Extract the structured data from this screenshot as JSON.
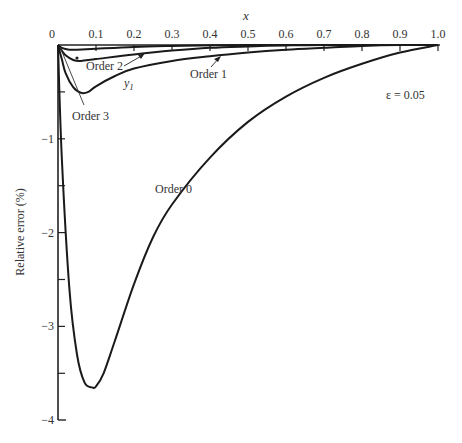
{
  "chart_data": {
    "type": "line",
    "title": "",
    "xlabel": "x",
    "ylabel": "Relative error (%)",
    "xlim": [
      0,
      1.0
    ],
    "ylim": [
      -4,
      0
    ],
    "x_ticks": [
      "0",
      "0.1",
      "0.2",
      "0.3",
      "0.4",
      "0.5",
      "0.6",
      "0.7",
      "0.8",
      "0.9",
      "1.0"
    ],
    "y_ticks": [
      "0",
      "-1",
      "-2",
      "-3",
      "-4"
    ],
    "x_axis_position": "top",
    "grid": false,
    "annotation": "ε = 0.05",
    "series": [
      {
        "name": "Order 0",
        "x": [
          0,
          0.01,
          0.03,
          0.05,
          0.07,
          0.09,
          0.1,
          0.12,
          0.15,
          0.2,
          0.25,
          0.3,
          0.4,
          0.5,
          0.6,
          0.7,
          0.8,
          0.9,
          1.0
        ],
        "y": [
          0,
          -1.2,
          -2.6,
          -3.3,
          -3.6,
          -3.65,
          -3.64,
          -3.5,
          -3.15,
          -2.55,
          -2.05,
          -1.7,
          -1.2,
          -0.82,
          -0.55,
          -0.35,
          -0.2,
          -0.08,
          0
        ]
      },
      {
        "name": "Order 1",
        "x": [
          0,
          0.01,
          0.02,
          0.04,
          0.06,
          0.08,
          0.1,
          0.15,
          0.2,
          0.3,
          0.4,
          0.5,
          0.6,
          0.7,
          0.8,
          0.9,
          1.0
        ],
        "y": [
          0,
          -0.15,
          -0.3,
          -0.45,
          -0.51,
          -0.5,
          -0.44,
          -0.33,
          -0.25,
          -0.17,
          -0.12,
          -0.08,
          -0.05,
          -0.03,
          -0.01,
          0,
          0
        ]
      },
      {
        "name": "Order 2",
        "x": [
          0,
          0.01,
          0.02,
          0.04,
          0.06,
          0.1,
          0.2,
          0.3,
          0.4,
          0.5,
          0.6,
          0.7,
          1.0
        ],
        "y": [
          0,
          -0.06,
          -0.11,
          -0.16,
          -0.17,
          -0.15,
          -0.1,
          -0.06,
          -0.03,
          -0.015,
          -0.005,
          0,
          0
        ]
      },
      {
        "name": "Order 3",
        "x": [
          0,
          0.01,
          0.03,
          0.05,
          0.1,
          0.2,
          0.3,
          0.5,
          1.0
        ],
        "y": [
          0,
          -0.03,
          -0.05,
          -0.05,
          -0.04,
          -0.02,
          -0.01,
          0,
          0
        ]
      }
    ],
    "labels": {
      "order0": "Order 0",
      "order1": "Order 1",
      "order2": "Order 2",
      "order3": "Order 3",
      "y1": "y",
      "y1_sub": "1"
    }
  }
}
